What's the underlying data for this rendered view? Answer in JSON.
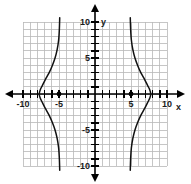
{
  "chart_data": {
    "type": "line",
    "title": "",
    "subtitle": "",
    "xlabel": "x",
    "ylabel": "y",
    "xlim": [
      -10.5,
      10.5
    ],
    "ylim": [
      -10.5,
      10.5
    ],
    "grid": true,
    "grid_step": 1,
    "legend": "none",
    "axis_arrows": true,
    "x_tick_labels": [
      {
        "value": -10,
        "text": "-10"
      },
      {
        "value": -5,
        "text": "-5"
      },
      {
        "value": 5,
        "text": "5"
      },
      {
        "value": 10,
        "text": "10"
      }
    ],
    "y_tick_labels": [
      {
        "value": 10,
        "text": "10"
      },
      {
        "value": 5,
        "text": "5"
      },
      {
        "value": -5,
        "text": "-5"
      },
      {
        "value": -10,
        "text": "-10"
      }
    ],
    "minor_tick_step": 1,
    "series": [
      {
        "name": "left-branch",
        "description": "left-opening branch of a horizontal hyperbola, vertex at (-5, 0)",
        "points": [
          [
            -4.9,
            -10.6
          ],
          [
            -4.95,
            -9.0
          ],
          [
            -5.05,
            -7.5
          ],
          [
            -5.25,
            -6.2
          ],
          [
            -5.55,
            -5.0
          ],
          [
            -5.95,
            -3.9
          ],
          [
            -6.4,
            -2.9
          ],
          [
            -6.9,
            -2.0
          ],
          [
            -7.3,
            -1.2
          ],
          [
            -7.6,
            -0.6
          ],
          [
            -7.75,
            0.0
          ],
          [
            -7.6,
            0.6
          ],
          [
            -7.3,
            1.2
          ],
          [
            -6.9,
            2.0
          ],
          [
            -6.4,
            2.9
          ],
          [
            -5.95,
            3.9
          ],
          [
            -5.55,
            5.0
          ],
          [
            -5.25,
            6.2
          ],
          [
            -5.05,
            7.5
          ],
          [
            -4.95,
            9.0
          ],
          [
            -4.9,
            10.6
          ]
        ]
      },
      {
        "name": "right-branch",
        "description": "right-opening branch of a horizontal hyperbola, vertex at (5, 0)",
        "points": [
          [
            4.9,
            -10.6
          ],
          [
            4.95,
            -9.0
          ],
          [
            5.05,
            -7.5
          ],
          [
            5.25,
            -6.2
          ],
          [
            5.55,
            -5.0
          ],
          [
            5.95,
            -3.9
          ],
          [
            6.4,
            -2.9
          ],
          [
            6.9,
            -2.0
          ],
          [
            7.3,
            -1.2
          ],
          [
            7.6,
            -0.6
          ],
          [
            7.75,
            0.0
          ],
          [
            7.6,
            0.6
          ],
          [
            7.3,
            1.2
          ],
          [
            6.9,
            2.0
          ],
          [
            6.4,
            2.9
          ],
          [
            5.95,
            3.9
          ],
          [
            5.55,
            5.0
          ],
          [
            5.25,
            6.2
          ],
          [
            5.05,
            7.5
          ],
          [
            4.95,
            9.0
          ],
          [
            4.9,
            10.6
          ]
        ]
      }
    ],
    "markers": [
      {
        "name": "vertex-left",
        "x": -5,
        "y": 0,
        "style": "filled-circle"
      },
      {
        "name": "vertex-right",
        "x": 5,
        "y": 0,
        "style": "filled-circle"
      }
    ],
    "colors": {
      "curve": "#111111",
      "axis": "#000000",
      "grid": "#b8b8b8",
      "background": "#ffffff",
      "marker": "#000000"
    }
  },
  "alt_text": "Coordinate grid from -10 to 10 on both axes showing a sideways hyperbola with vertices marked at (-5, 0) and (5, 0)."
}
